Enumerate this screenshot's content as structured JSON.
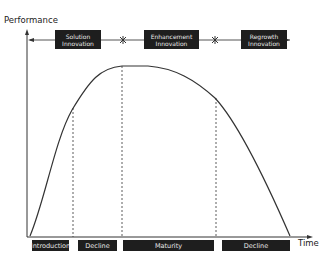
{
  "axes": {
    "y_label": "Performance",
    "x_label": "Time"
  },
  "innovations": [
    {
      "label_line1": "Solution",
      "label_line2": "Innovation"
    },
    {
      "label_line1": "Enhancement",
      "label_line2": "Innovation"
    },
    {
      "label_line1": "Regrowth",
      "label_line2": "Innovation"
    }
  ],
  "separators": [
    "break-mark",
    "break-mark"
  ],
  "phases": [
    {
      "label": "Introduction"
    },
    {
      "label": "Decline"
    },
    {
      "label": "Maturity"
    },
    {
      "label": "Decline"
    }
  ],
  "colors": {
    "box_fill": "#1e1e1e",
    "box_text": "#e8e8e8",
    "line": "#333333"
  }
}
